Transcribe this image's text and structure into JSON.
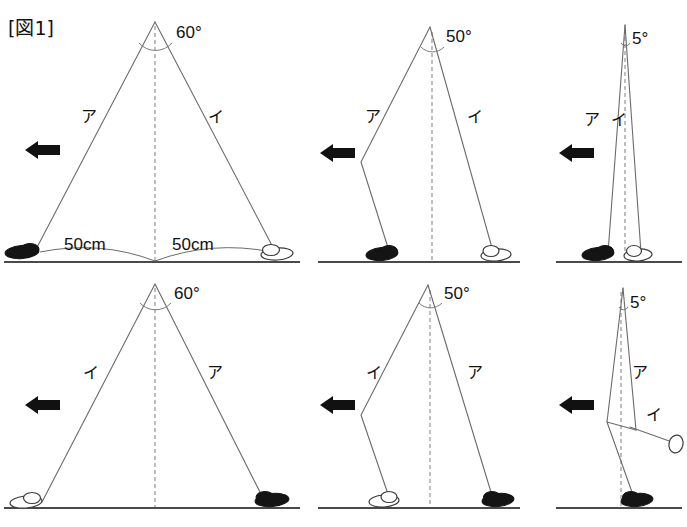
{
  "figure": {
    "title": "[図1]",
    "background_color": "#ffffff",
    "line_color": "#6b6b6b",
    "ground_color": "#4a4a4a",
    "ink_color": "#111111",
    "dark_shoe_color": "#141414",
    "light_shoe_color": "#ffffff"
  },
  "dimensions": {
    "left_label": "50cm",
    "right_label": "50cm"
  },
  "panels": [
    {
      "id": "top-left",
      "angle": "60°",
      "left_leg_label": "ア",
      "right_leg_label": "イ",
      "left_shoe": "dark",
      "right_shoe": "light",
      "arrow": "left-arrow",
      "shows_dimensions": true,
      "knee_bend": false
    },
    {
      "id": "top-middle",
      "angle": "50°",
      "left_leg_label": "ア",
      "right_leg_label": "イ",
      "left_shoe": "dark",
      "right_shoe": "light",
      "arrow": "left-arrow",
      "shows_dimensions": false,
      "knee_bend": true
    },
    {
      "id": "top-right",
      "angle": "5°",
      "left_leg_label": "ア",
      "right_leg_label": "イ",
      "left_shoe": "dark",
      "right_shoe": "light",
      "arrow": "left-arrow",
      "shows_dimensions": false,
      "knee_bend": false
    },
    {
      "id": "bottom-left",
      "angle": "60°",
      "left_leg_label": "イ",
      "right_leg_label": "ア",
      "left_shoe": "light",
      "right_shoe": "dark",
      "arrow": "left-arrow",
      "shows_dimensions": false,
      "knee_bend": false
    },
    {
      "id": "bottom-middle",
      "angle": "50°",
      "left_leg_label": "イ",
      "right_leg_label": "ア",
      "left_shoe": "light",
      "right_shoe": "dark",
      "arrow": "left-arrow",
      "shows_dimensions": false,
      "knee_bend": true
    },
    {
      "id": "bottom-right",
      "angle": "5°",
      "left_leg_label": "ア",
      "right_leg_label": "イ",
      "left_shoe": "dark",
      "right_shoe": "light",
      "arrow": "left-arrow",
      "shows_dimensions": false,
      "knee_bend": false,
      "swing_leg": true
    }
  ]
}
